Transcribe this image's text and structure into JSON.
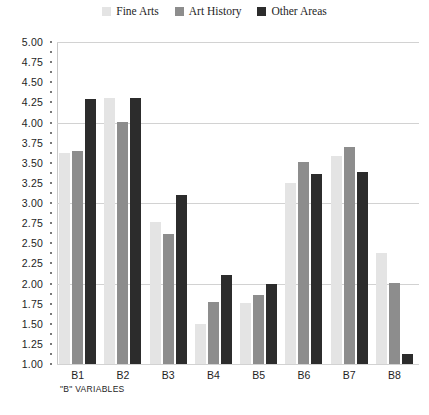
{
  "chart_data": {
    "type": "bar",
    "title": "",
    "subtitle": "",
    "xlabel": "\"B\" VARIABLES",
    "ylabel": "",
    "categories": [
      "B1",
      "B2",
      "B3",
      "B4",
      "B5",
      "B6",
      "B7",
      "B8"
    ],
    "series": [
      {
        "name": "Fine Arts",
        "color": "#e4e4e4",
        "values": [
          3.62,
          4.3,
          2.76,
          1.5,
          1.76,
          3.25,
          3.59,
          2.38
        ]
      },
      {
        "name": "Art History",
        "color": "#8d8d8d",
        "values": [
          3.64,
          4.01,
          2.62,
          1.77,
          1.86,
          3.51,
          3.7,
          2.01
        ]
      },
      {
        "name": "Other Areas",
        "color": "#2c2c2c",
        "values": [
          4.29,
          4.3,
          3.1,
          2.11,
          2.0,
          3.36,
          3.39,
          1.12
        ]
      }
    ],
    "ylim": [
      1.0,
      5.0
    ],
    "ytick_step": 0.25,
    "ytick_labels": [
      "5.00",
      "4.75",
      "4.50",
      "4.25",
      "4.00",
      "3.75",
      "3.50",
      "3.25",
      "3.00",
      "2.75",
      "2.50",
      "2.25",
      "2.00",
      "1.75",
      "1.50",
      "1.25",
      "1.00"
    ],
    "gridline_values": [
      1.0,
      2.0,
      3.0,
      4.0,
      5.0
    ],
    "grid": true,
    "legend_position": "top-center"
  },
  "legend": {
    "items": [
      {
        "label": "Fine Arts"
      },
      {
        "label": "Art History"
      },
      {
        "label": "Other Areas"
      }
    ]
  },
  "axis": {
    "x_title": "\"B\" VARIABLES"
  }
}
